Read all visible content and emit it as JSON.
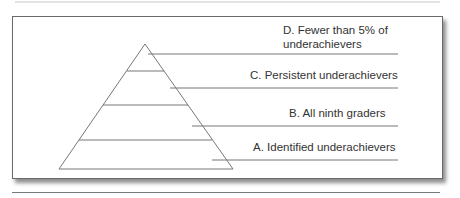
{
  "diagram": {
    "type": "pyramid",
    "levels": [
      {
        "id": "D",
        "label_line1": "D. Fewer than 5% of",
        "label_line2": "underachievers"
      },
      {
        "id": "C",
        "label": "C. Persistent underachievers"
      },
      {
        "id": "B",
        "label": "B. All ninth graders"
      },
      {
        "id": "A",
        "label": "A. Identified underachievers"
      }
    ],
    "colors": {
      "line": "#777777",
      "text": "#333333"
    }
  }
}
